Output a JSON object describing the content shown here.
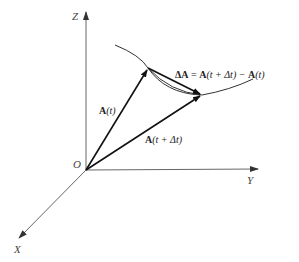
{
  "diagram": {
    "type": "vector-derivative-3d",
    "axes": {
      "z_label": "Z",
      "y_label": "Y",
      "x_label": "X",
      "origin_label": "O"
    },
    "vectors": {
      "a_t": {
        "bold": "A",
        "rest": "(t)"
      },
      "a_t_dt": {
        "bold": "A",
        "rest": "(t + Δt)"
      },
      "delta_a": {
        "bold1": "ΔA",
        "eq": " = ",
        "bold2": "A",
        "mid": "(t + Δt) − ",
        "bold3": "A",
        "end": "(t)"
      }
    },
    "colors": {
      "axis": "#555555",
      "vector": "#111111",
      "curve": "#333333"
    }
  }
}
